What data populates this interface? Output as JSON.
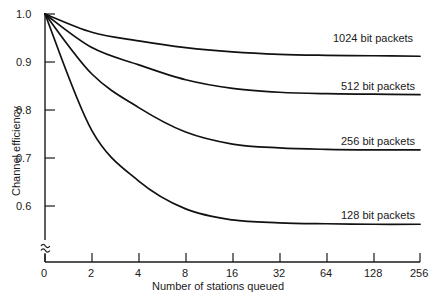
{
  "chart_data": {
    "type": "line",
    "title": "",
    "xlabel": "Number of stations queued",
    "ylabel": "Channel efficiency",
    "xticklabels": [
      "0",
      "2",
      "4",
      "8",
      "16",
      "32",
      "64",
      "128",
      "256"
    ],
    "xtickvalues": [
      0,
      2,
      4,
      8,
      16,
      32,
      64,
      128,
      256
    ],
    "yticklabels": [
      "1.0",
      "0.9",
      "0.8",
      "0.7",
      "0.6"
    ],
    "ytickvalues": [
      1.0,
      0.9,
      0.8,
      0.7,
      0.6
    ],
    "ylim": [
      0.54,
      1.0
    ],
    "y_axis_break": true,
    "y_axis_break_symbol": "≈",
    "grid": false,
    "legend_position": "inline-right-of-curve",
    "x_scale": "category-even-spacing",
    "series": [
      {
        "name": "1024 bit packets",
        "label": "1024 bit packets",
        "x": [
          0,
          2,
          4,
          8,
          16,
          32,
          64,
          128,
          256
        ],
        "values": [
          1.0,
          0.962,
          0.944,
          0.93,
          0.921,
          0.916,
          0.914,
          0.913,
          0.912
        ]
      },
      {
        "name": "512 bit packets",
        "label": "512 bit packets",
        "x": [
          0,
          2,
          4,
          8,
          16,
          32,
          64,
          128,
          256
        ],
        "values": [
          1.0,
          0.93,
          0.894,
          0.863,
          0.845,
          0.837,
          0.834,
          0.833,
          0.832
        ]
      },
      {
        "name": "256 bit packets",
        "label": "256 bit packets",
        "x": [
          0,
          2,
          4,
          8,
          16,
          32,
          64,
          128,
          256
        ],
        "values": [
          1.0,
          0.875,
          0.805,
          0.754,
          0.729,
          0.721,
          0.718,
          0.717,
          0.717
        ]
      },
      {
        "name": "128 bit packets",
        "label": "128 bit packets",
        "x": [
          0,
          2,
          4,
          8,
          16,
          32,
          64,
          128,
          256
        ],
        "values": [
          1.0,
          0.757,
          0.652,
          0.594,
          0.571,
          0.565,
          0.563,
          0.562,
          0.562
        ]
      }
    ],
    "colors": {
      "axis": "#1a1a1a",
      "curve": "#111111",
      "background": "#ffffff"
    }
  }
}
